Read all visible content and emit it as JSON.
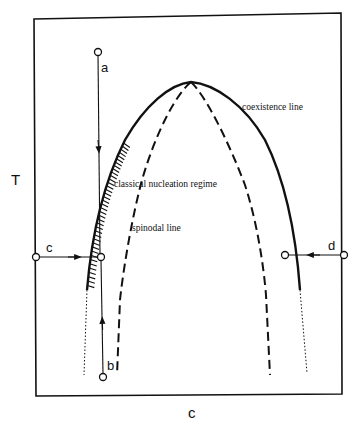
{
  "diagram": {
    "axes": {
      "y_label": "T",
      "x_label": "c"
    },
    "curves": {
      "coexistence_label": "coexistence line",
      "spinodal_label": "spinodal line",
      "region_label": "classical nucleation regime"
    },
    "paths": [
      {
        "id": "a",
        "label": "a",
        "direction": "down"
      },
      {
        "id": "b",
        "label": "b",
        "direction": "up"
      },
      {
        "id": "c",
        "label": "c",
        "direction": "right"
      },
      {
        "id": "d",
        "label": "d",
        "direction": "left"
      }
    ],
    "colors": {
      "ink": "#111111",
      "background": "#ffffff"
    }
  }
}
